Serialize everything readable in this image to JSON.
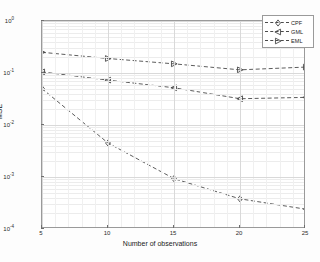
{
  "chart_data": {
    "type": "line",
    "title": "",
    "xlabel": "Number of observations",
    "ylabel": "MSE",
    "x": [
      5,
      10,
      15,
      20,
      25
    ],
    "xlim": [
      5,
      25
    ],
    "ylim": [
      0.0001,
      1
    ],
    "yscale": "log",
    "xscale": "linear",
    "grid": true,
    "legend_position": "top-right",
    "xticks": [
      "5",
      "10",
      "15",
      "20",
      "25"
    ],
    "yticks": [
      "10^0",
      "10^-1",
      "10^-2",
      "10^-3",
      "10^-4"
    ],
    "series": [
      {
        "name": "CPF",
        "marker": "diamond",
        "linestyle": "dashed",
        "color": "#4a4a4a",
        "values": [
          0.05,
          0.0045,
          0.00093,
          0.00038,
          0.00024
        ]
      },
      {
        "name": "GML",
        "marker": "triangle-left",
        "linestyle": "dashed",
        "color": "#4a4a4a",
        "values": [
          0.105,
          0.073,
          0.052,
          0.032,
          0.034
        ]
      },
      {
        "name": "EML",
        "marker": "triangle-right",
        "linestyle": "dashed",
        "color": "#4a4a4a",
        "values": [
          0.25,
          0.19,
          0.15,
          0.115,
          0.13
        ]
      }
    ]
  },
  "axis": {
    "ytick_labels": [
      {
        "mantissa": "10",
        "exponent": "0"
      },
      {
        "mantissa": "10",
        "exponent": "-1"
      },
      {
        "mantissa": "10",
        "exponent": "-2"
      },
      {
        "mantissa": "10",
        "exponent": "-3"
      },
      {
        "mantissa": "10",
        "exponent": "-4"
      }
    ]
  },
  "legend": {
    "items": [
      {
        "label": "CPF"
      },
      {
        "label": "GML"
      },
      {
        "label": "EML"
      }
    ]
  }
}
